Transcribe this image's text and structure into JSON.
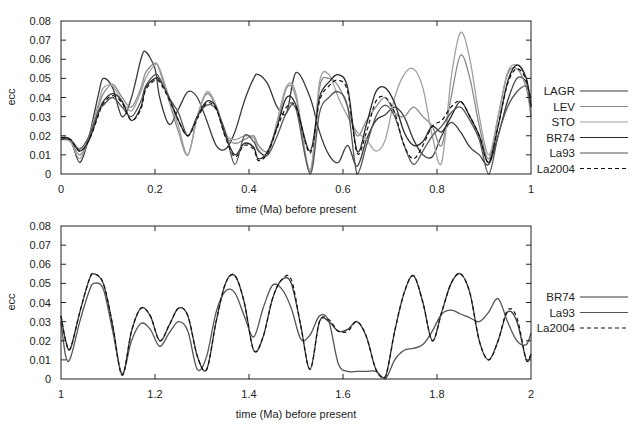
{
  "chart_data": [
    {
      "type": "line",
      "title": "",
      "xlabel": "time (Ma) before present",
      "ylabel": "ecc",
      "xlim": [
        0,
        1
      ],
      "ylim": [
        0,
        0.08
      ],
      "xticks": [
        "0",
        "0.2",
        "0.4",
        "0.6",
        "0.8",
        "1"
      ],
      "yticks": [
        "0",
        "0.01",
        "0.02",
        "0.03",
        "0.04",
        "0.05",
        "0.06",
        "0.07",
        "0.08"
      ],
      "grid": false,
      "legend_position": "right",
      "x": [
        0,
        0.02,
        0.04,
        0.06,
        0.08,
        0.09,
        0.11,
        0.13,
        0.15,
        0.17,
        0.18,
        0.2,
        0.21,
        0.23,
        0.25,
        0.27,
        0.29,
        0.31,
        0.33,
        0.35,
        0.37,
        0.39,
        0.41,
        0.42,
        0.44,
        0.46,
        0.48,
        0.5,
        0.53,
        0.55,
        0.57,
        0.59,
        0.61,
        0.63,
        0.65,
        0.67,
        0.69,
        0.71,
        0.73,
        0.75,
        0.77,
        0.79,
        0.81,
        0.83,
        0.85,
        0.87,
        0.89,
        0.91,
        0.93,
        0.95,
        0.97,
        0.99,
        1.0
      ],
      "series": [
        {
          "name": "LAGR",
          "color": "#3a3a3a",
          "dash": "",
          "values": [
            0.019,
            0.018,
            0.006,
            0.02,
            0.042,
            0.05,
            0.045,
            0.03,
            0.04,
            0.06,
            0.064,
            0.055,
            0.04,
            0.026,
            0.034,
            0.043,
            0.04,
            0.028,
            0.015,
            0.013,
            0.022,
            0.038,
            0.05,
            0.052,
            0.047,
            0.035,
            0.032,
            0.053,
            0.04,
            0.022,
            0.01,
            0.006,
            0.015,
            0.004,
            0.018,
            0.028,
            0.031,
            0.035,
            0.03,
            0.018,
            0.01,
            0.009,
            0.02,
            0.027,
            0.022,
            0.014,
            0.01,
            0.005,
            0.02,
            0.038,
            0.05,
            0.048,
            0.036
          ]
        },
        {
          "name": "LEV",
          "color": "#8a8a8a",
          "dash": "",
          "values": [
            0.019,
            0.017,
            0.01,
            0.018,
            0.035,
            0.042,
            0.047,
            0.04,
            0.035,
            0.045,
            0.053,
            0.058,
            0.054,
            0.038,
            0.022,
            0.01,
            0.03,
            0.042,
            0.035,
            0.02,
            0.016,
            0.018,
            0.02,
            0.015,
            0.012,
            0.025,
            0.045,
            0.04,
            0.001,
            0.045,
            0.05,
            0.046,
            0.035,
            0.02,
            0.028,
            0.035,
            0.04,
            0.032,
            0.03,
            0.035,
            0.03,
            0.025,
            0.015,
            0.04,
            0.062,
            0.05,
            0.025,
            0.008,
            0.03,
            0.052,
            0.055,
            0.045,
            0.03
          ]
        },
        {
          "name": "STO",
          "color": "#a0a0a0",
          "dash": "",
          "values": [
            0.018,
            0.017,
            0.008,
            0.02,
            0.037,
            0.045,
            0.046,
            0.038,
            0.033,
            0.043,
            0.05,
            0.057,
            0.055,
            0.04,
            0.025,
            0.01,
            0.03,
            0.043,
            0.036,
            0.021,
            0.018,
            0.02,
            0.019,
            0.013,
            0.01,
            0.028,
            0.046,
            0.042,
            0.002,
            0.048,
            0.052,
            0.04,
            0.03,
            0.022,
            0.018,
            0.012,
            0.018,
            0.04,
            0.052,
            0.055,
            0.045,
            0.02,
            0.006,
            0.05,
            0.074,
            0.06,
            0.03,
            0.01,
            0.03,
            0.053,
            0.057,
            0.05,
            0.035
          ]
        },
        {
          "name": "BR74",
          "color": "#2a2a2a",
          "dash": "",
          "values": [
            0.019,
            0.018,
            0.012,
            0.018,
            0.032,
            0.038,
            0.042,
            0.038,
            0.028,
            0.035,
            0.045,
            0.05,
            0.049,
            0.04,
            0.028,
            0.02,
            0.03,
            0.038,
            0.035,
            0.02,
            0.01,
            0.016,
            0.014,
            0.008,
            0.012,
            0.025,
            0.04,
            0.036,
            0.012,
            0.04,
            0.048,
            0.052,
            0.045,
            0.012,
            0.026,
            0.043,
            0.045,
            0.037,
            0.022,
            0.015,
            0.017,
            0.025,
            0.022,
            0.03,
            0.038,
            0.03,
            0.02,
            0.006,
            0.025,
            0.048,
            0.057,
            0.05,
            0.035
          ]
        },
        {
          "name": "La93",
          "color": "#555555",
          "dash": "",
          "values": [
            0.018,
            0.018,
            0.013,
            0.02,
            0.033,
            0.036,
            0.04,
            0.035,
            0.03,
            0.038,
            0.046,
            0.052,
            0.05,
            0.04,
            0.032,
            0.02,
            0.03,
            0.036,
            0.034,
            0.022,
            0.005,
            0.02,
            0.017,
            0.012,
            0.01,
            0.02,
            0.032,
            0.034,
            0.0,
            0.032,
            0.04,
            0.043,
            0.035,
            0.0,
            0.015,
            0.03,
            0.036,
            0.03,
            0.015,
            0.005,
            0.012,
            0.02,
            0.025,
            0.032,
            0.035,
            0.028,
            0.018,
            0.0,
            0.02,
            0.035,
            0.043,
            0.046,
            0.04
          ]
        },
        {
          "name": "La2004",
          "color": "#111111",
          "dash": "4,3",
          "values": [
            0.019,
            0.018,
            0.012,
            0.018,
            0.031,
            0.037,
            0.041,
            0.037,
            0.028,
            0.034,
            0.044,
            0.049,
            0.048,
            0.039,
            0.028,
            0.02,
            0.029,
            0.037,
            0.034,
            0.019,
            0.009,
            0.015,
            0.013,
            0.007,
            0.011,
            0.024,
            0.035,
            0.035,
            0.011,
            0.038,
            0.046,
            0.049,
            0.043,
            0.011,
            0.022,
            0.038,
            0.04,
            0.032,
            0.015,
            0.008,
            0.015,
            0.025,
            0.028,
            0.035,
            0.038,
            0.03,
            0.02,
            0.006,
            0.025,
            0.047,
            0.055,
            0.049,
            0.035
          ]
        }
      ]
    },
    {
      "type": "line",
      "title": "",
      "xlabel": "time (Ma) before present",
      "ylabel": "ecc",
      "xlim": [
        1,
        2
      ],
      "ylim": [
        0,
        0.08
      ],
      "xticks": [
        "1",
        "1.2",
        "1.4",
        "1.6",
        "1.8",
        "2"
      ],
      "yticks": [
        "0",
        "0.01",
        "0.02",
        "0.03",
        "0.04",
        "0.05",
        "0.06",
        "0.07",
        "0.08"
      ],
      "grid": false,
      "legend_position": "right",
      "x": [
        1.0,
        1.01,
        1.02,
        1.04,
        1.06,
        1.07,
        1.09,
        1.11,
        1.13,
        1.15,
        1.17,
        1.19,
        1.21,
        1.23,
        1.25,
        1.27,
        1.29,
        1.31,
        1.33,
        1.35,
        1.37,
        1.39,
        1.41,
        1.43,
        1.45,
        1.47,
        1.49,
        1.51,
        1.53,
        1.55,
        1.57,
        1.59,
        1.61,
        1.63,
        1.65,
        1.67,
        1.69,
        1.71,
        1.73,
        1.75,
        1.77,
        1.79,
        1.81,
        1.83,
        1.85,
        1.87,
        1.89,
        1.91,
        1.93,
        1.95,
        1.97,
        1.99,
        2.0
      ],
      "series": [
        {
          "name": "BR74",
          "color": "#3a3a3a",
          "dash": "",
          "values": [
            0.033,
            0.02,
            0.016,
            0.035,
            0.052,
            0.055,
            0.05,
            0.028,
            0.002,
            0.025,
            0.037,
            0.033,
            0.02,
            0.028,
            0.037,
            0.033,
            0.012,
            0.005,
            0.03,
            0.05,
            0.054,
            0.04,
            0.015,
            0.022,
            0.042,
            0.052,
            0.05,
            0.028,
            0.005,
            0.03,
            0.03,
            0.025,
            0.026,
            0.03,
            0.022,
            0.005,
            0.001,
            0.025,
            0.045,
            0.054,
            0.04,
            0.02,
            0.035,
            0.05,
            0.055,
            0.045,
            0.02,
            0.01,
            0.02,
            0.035,
            0.03,
            0.01,
            0.013
          ]
        },
        {
          "name": "La93",
          "color": "#555555",
          "dash": "",
          "values": [
            0.03,
            0.012,
            0.011,
            0.03,
            0.046,
            0.05,
            0.047,
            0.025,
            0.003,
            0.02,
            0.029,
            0.026,
            0.017,
            0.024,
            0.03,
            0.025,
            0.005,
            0.012,
            0.035,
            0.046,
            0.045,
            0.033,
            0.022,
            0.037,
            0.049,
            0.047,
            0.037,
            0.021,
            0.023,
            0.033,
            0.03,
            0.008,
            0.004,
            0.004,
            0.004,
            0.004,
            0.0,
            0.01,
            0.015,
            0.016,
            0.018,
            0.025,
            0.034,
            0.036,
            0.034,
            0.032,
            0.03,
            0.035,
            0.042,
            0.03,
            0.02,
            0.018,
            0.024
          ]
        },
        {
          "name": "La2004",
          "color": "#111111",
          "dash": "4,3",
          "values": [
            0.033,
            0.02,
            0.016,
            0.035,
            0.052,
            0.055,
            0.05,
            0.028,
            0.002,
            0.025,
            0.037,
            0.033,
            0.02,
            0.028,
            0.037,
            0.033,
            0.012,
            0.005,
            0.03,
            0.05,
            0.054,
            0.04,
            0.015,
            0.022,
            0.042,
            0.052,
            0.052,
            0.028,
            0.005,
            0.03,
            0.031,
            0.025,
            0.025,
            0.03,
            0.022,
            0.005,
            0.001,
            0.025,
            0.045,
            0.054,
            0.04,
            0.02,
            0.035,
            0.05,
            0.055,
            0.045,
            0.02,
            0.01,
            0.02,
            0.036,
            0.032,
            0.01,
            0.013
          ]
        }
      ]
    }
  ]
}
